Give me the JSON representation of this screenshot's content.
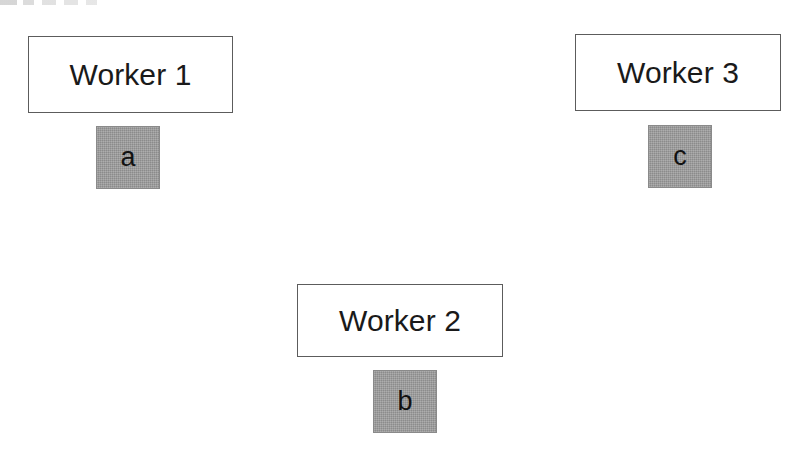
{
  "diagram": {
    "background_color": "#ffffff",
    "box_border_color": "#5c5c5c",
    "task_fill_color": "#9a9a9a",
    "text_color": "#1a1a1a",
    "nodes": [
      {
        "id": "worker-1",
        "label": "Worker 1",
        "task": "a",
        "position": "top-left"
      },
      {
        "id": "worker-2",
        "label": "Worker 2",
        "task": "b",
        "position": "bottom-center"
      },
      {
        "id": "worker-3",
        "label": "Worker 3",
        "task": "c",
        "position": "top-right"
      }
    ]
  }
}
